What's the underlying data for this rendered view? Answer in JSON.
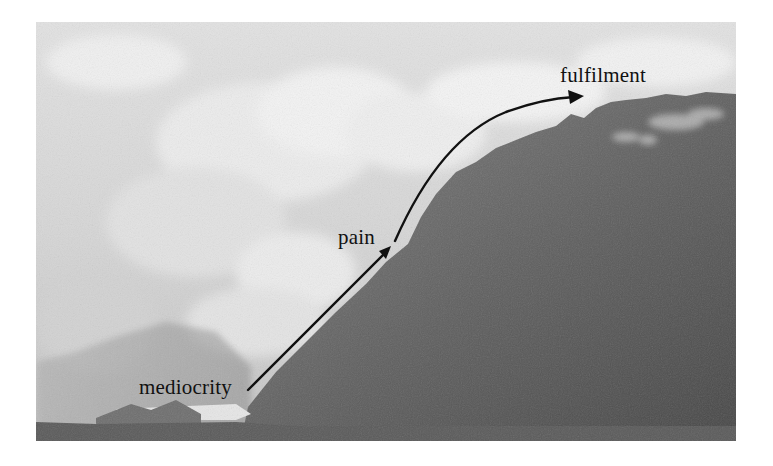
{
  "figure": {
    "kind": "annotated-photograph",
    "labels": {
      "start": "mediocrity",
      "middle": "pain",
      "end": "fulfilment"
    },
    "colors": {
      "sky": "#dcdcdc",
      "cloud": "#f2f2f2",
      "mountain_light": "#7a7a7a",
      "mountain_dark": "#4e4e4e",
      "foreground": "#5a5a5a",
      "lake": "#e6e6e6",
      "arrow": "#111111",
      "text": "#111111"
    }
  }
}
